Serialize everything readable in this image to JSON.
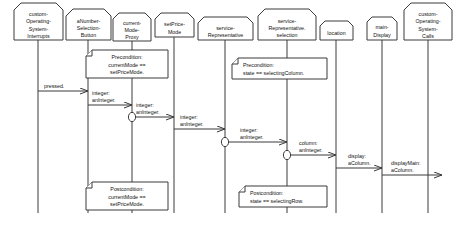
{
  "diagram": {
    "type": "sequence-diagram",
    "background_color": "#ffffff",
    "line_color": "#3a3a3a",
    "text_color": "#111111"
  },
  "objects": [
    {
      "id": "custom-operating-system-interrupts",
      "lines": [
        "custom-",
        "Operating-",
        "System-",
        "Interrupts"
      ],
      "box": {
        "x": 14,
        "y": 3,
        "w": 49,
        "h": 37,
        "notch": 7
      },
      "lifeline_x": 38,
      "lifeline_bottom": 213
    },
    {
      "id": "anumber-selection-button",
      "lines": [
        "aNumber-",
        "Selection-",
        "Button"
      ],
      "box": {
        "x": 66,
        "y": 9,
        "w": 45,
        "h": 31,
        "notch": 7
      },
      "lifeline_x": 88,
      "lifeline_bottom": 213
    },
    {
      "id": "current-mode-proxy",
      "lines": [
        "current-",
        "Mode-",
        "Proxy"
      ],
      "box": {
        "x": 113,
        "y": 13,
        "w": 38,
        "h": 28,
        "notch": 6
      },
      "lifeline_x": 132,
      "lifeline_bottom": 213
    },
    {
      "id": "setprice-mode",
      "lines": [
        "setPrice-",
        "Mode"
      ],
      "box": {
        "x": 155,
        "y": 13,
        "w": 39,
        "h": 24,
        "notch": 6
      },
      "lifeline_x": 174,
      "lifeline_bottom": 213
    },
    {
      "id": "service-representative",
      "lines": [
        "service-",
        "Representative"
      ],
      "box": {
        "x": 198,
        "y": 17,
        "w": 55,
        "h": 23,
        "notch": 6
      },
      "lifeline_x": 225,
      "lifeline_bottom": 213
    },
    {
      "id": "service-representative-selection",
      "lines": [
        "service-",
        "Representative.",
        "selection"
      ],
      "box": {
        "x": 258,
        "y": 9,
        "w": 58,
        "h": 31,
        "notch": 7
      },
      "lifeline_x": 287,
      "lifeline_bottom": 213
    },
    {
      "id": "location",
      "lines": [
        "location"
      ],
      "box": {
        "x": 320,
        "y": 21,
        "w": 33,
        "h": 19,
        "notch": 5
      },
      "lifeline_x": 336,
      "lifeline_bottom": 213
    },
    {
      "id": "main-display",
      "lines": [
        "main-",
        "Display"
      ],
      "box": {
        "x": 367,
        "y": 17,
        "w": 30,
        "h": 23,
        "notch": 5
      },
      "lifeline_x": 382,
      "lifeline_bottom": 213
    },
    {
      "id": "custom-operating-system-calls",
      "lines": [
        "custom-",
        "Operating-",
        "System-",
        "Calls"
      ],
      "box": {
        "x": 404,
        "y": 3,
        "w": 48,
        "h": 37,
        "notch": 7
      },
      "lifeline_x": 428,
      "lifeline_bottom": 213
    }
  ],
  "messages": [
    {
      "id": "pressed",
      "label_lines": [
        "pressed."
      ],
      "from": "custom-operating-system-interrupts",
      "to": "anumber-selection-button",
      "x1": 38,
      "x2": 88,
      "y": 91,
      "label_x": 44,
      "label_y": 88,
      "marker": false
    },
    {
      "id": "integer-aninteger-1",
      "label_lines": [
        "integer:",
        "anInteger."
      ],
      "from": "anumber-selection-button",
      "to": "current-mode-proxy",
      "x1": 88,
      "x2": 132,
      "y": 105,
      "label_x": 92,
      "label_y": 95,
      "marker": false
    },
    {
      "id": "integer-aninteger-2",
      "label_lines": [
        "integer:",
        "anInteger."
      ],
      "from": "current-mode-proxy",
      "to": "setprice-mode",
      "x1": 132,
      "x2": 174,
      "y": 117,
      "label_x": 136,
      "label_y": 107,
      "marker": true
    },
    {
      "id": "integer-aninteger-3",
      "label_lines": [
        "integer:",
        "anInteger."
      ],
      "from": "setprice-mode",
      "to": "service-representative",
      "x1": 174,
      "x2": 225,
      "y": 129,
      "label_x": 180,
      "label_y": 119,
      "marker": false
    },
    {
      "id": "integer-aninteger-4",
      "label_lines": [
        "integer:",
        "anInteger."
      ],
      "from": "service-representative",
      "to": "service-representative-selection",
      "x1": 225,
      "x2": 287,
      "y": 142,
      "label_x": 240,
      "label_y": 132,
      "marker": true
    },
    {
      "id": "column-aninteger",
      "label_lines": [
        "column:",
        "anInteger."
      ],
      "from": "service-representative-selection",
      "to": "location",
      "x1": 287,
      "x2": 336,
      "y": 155,
      "label_x": 299,
      "label_y": 145,
      "marker": true
    },
    {
      "id": "display-acolumn",
      "label_lines": [
        "display:",
        "aColumn."
      ],
      "from": "location",
      "to": "main-display",
      "x1": 336,
      "x2": 382,
      "y": 168,
      "label_x": 348,
      "label_y": 158,
      "marker": false
    },
    {
      "id": "displaymain-acolumn",
      "label_lines": [
        "displayMain:",
        "aColumn."
      ],
      "from": "main-display",
      "to": "custom-operating-system-calls",
      "x1": 382,
      "x2": 442,
      "y": 175,
      "label_x": 391,
      "label_y": 165,
      "marker": false
    }
  ],
  "notes": [
    {
      "id": "precondition-currentmode",
      "lines": [
        "Precondition:",
        "currentMode ==",
        "setPriceMode."
      ],
      "align": "center",
      "box": {
        "x": 86,
        "y": 50,
        "w": 82,
        "h": 28
      },
      "fold": 6
    },
    {
      "id": "precondition-state-selectingcolumn",
      "lines": [
        "Precondition:",
        "state == selectingColumn."
      ],
      "align": "left",
      "box": {
        "x": 232,
        "y": 58,
        "w": 95,
        "h": 21
      },
      "fold": 6
    },
    {
      "id": "postcondition-currentmode",
      "lines": [
        "Postcondition:",
        "currentMode ==",
        "setPriceMode."
      ],
      "align": "center",
      "box": {
        "x": 86,
        "y": 182,
        "w": 82,
        "h": 28
      },
      "fold": 6
    },
    {
      "id": "postcondition-state-selectingrow",
      "lines": [
        "Postcondition:",
        "state == selectingRow."
      ],
      "align": "left",
      "box": {
        "x": 239,
        "y": 186,
        "w": 88,
        "h": 21
      },
      "fold": 6
    }
  ]
}
